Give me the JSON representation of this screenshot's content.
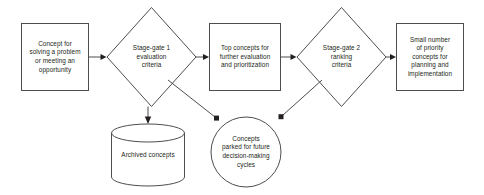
{
  "diagram": {
    "type": "flowchart",
    "orientation": "left-to-right",
    "colors": {
      "shape_stroke": "#4d4d4f",
      "shape_fill": "#ffffff",
      "text": "#231f20",
      "connector": "#4d4d4f",
      "background": "#ffffff"
    },
    "nodes": [
      {
        "id": "concept-input",
        "shape": "rectangle",
        "label": "Concept for\nsolving a problem\nor meeting an\nopportunity"
      },
      {
        "id": "stage-gate-1",
        "shape": "diamond",
        "label": "Stage-gate 1\nevaluation\ncriteria"
      },
      {
        "id": "top-concepts",
        "shape": "rectangle",
        "label": "Top concepts for\nfurther evaluation\nand prioritization"
      },
      {
        "id": "stage-gate-2",
        "shape": "diamond",
        "label": "Stage-gate 2\nranking\ncriteria"
      },
      {
        "id": "priority-concepts",
        "shape": "rectangle",
        "label": "Small number\nof priority\nconcepts for\nplanning and\nimplementation"
      },
      {
        "id": "archived-concepts",
        "shape": "cylinder",
        "label": "Archived concepts"
      },
      {
        "id": "parked-concepts",
        "shape": "circle",
        "label": "Concepts\nparked for future\ndecision-making\ncycles"
      }
    ],
    "edges": [
      {
        "id": "edge-concept-to-gate1",
        "from": "concept-input",
        "to": "stage-gate-1",
        "label": "",
        "style": "solid-arrow"
      },
      {
        "id": "edge-gate1-to-top",
        "from": "stage-gate-1",
        "to": "top-concepts",
        "label": "",
        "style": "solid-arrow"
      },
      {
        "id": "edge-top-to-gate2",
        "from": "top-concepts",
        "to": "stage-gate-2",
        "label": "",
        "style": "solid-arrow"
      },
      {
        "id": "edge-gate2-to-priority",
        "from": "stage-gate-2",
        "to": "priority-concepts",
        "label": "",
        "style": "solid-arrow"
      },
      {
        "id": "edge-gate1-to-archived",
        "from": "stage-gate-1",
        "to": "archived-concepts",
        "label": "",
        "style": "solid-arrow"
      },
      {
        "id": "edge-gate1-to-parked",
        "from": "stage-gate-1",
        "to": "parked-concepts",
        "label": "",
        "style": "solid-arrow"
      },
      {
        "id": "edge-gate2-to-parked",
        "from": "stage-gate-2",
        "to": "parked-concepts",
        "label": "",
        "style": "solid-arrow"
      }
    ]
  }
}
